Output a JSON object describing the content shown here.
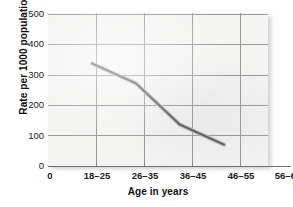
{
  "chart_data": {
    "type": "line",
    "title": "",
    "xlabel": "Age in years",
    "ylabel": "Rate per 1000 population",
    "categories": [
      "0",
      "18–25",
      "26–35",
      "36–45",
      "46–55",
      "56–65"
    ],
    "x_tick_labels": [
      "0",
      "18–25",
      "26–35",
      "36–45",
      "46–55",
      "56–65"
    ],
    "y_tick_labels": [
      "0",
      "100",
      "200",
      "300",
      "400",
      "500"
    ],
    "y_ticks": [
      0,
      100,
      200,
      300,
      400,
      500
    ],
    "ylim": [
      0,
      500
    ],
    "grid": "both",
    "legend": "none",
    "series": [
      {
        "name": "Rate per 1000 population",
        "color": "#5a5a5a",
        "x": [
          "18–25",
          "26–35",
          "36–45",
          "46–55"
        ],
        "values": [
          335,
          270,
          135,
          70
        ]
      }
    ],
    "points": [
      {
        "x": "18–25",
        "y": 335
      },
      {
        "x": "26–35",
        "y": 270
      },
      {
        "x": "36–45",
        "y": 135
      },
      {
        "x": "46–55",
        "y": 70
      }
    ],
    "annotations": []
  },
  "style": {
    "plot_background": "#f4f4f3",
    "grid_color": "#9a9a9a",
    "axis_color": "#6e6e6e",
    "line_color": "#5a5a5a",
    "text_color": "#1b1b1b"
  }
}
